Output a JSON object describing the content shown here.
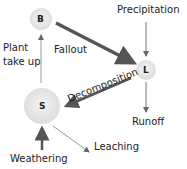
{
  "nodes": [
    {
      "id": "B",
      "label": "B"
    },
    {
      "id": "L",
      "label": "L"
    },
    {
      "id": "S",
      "label": "S"
    }
  ],
  "labels": {
    "precipitation": "Precipitation",
    "plant_take_up_1": "Plant",
    "plant_take_up_2": "take up",
    "fallout": "Fallout",
    "decomposition": "Decomposition",
    "runoff": "Runoff",
    "leaching": "Leaching",
    "weathering": "Weathering"
  },
  "colors": {
    "node_fill": "#e6e6e6",
    "thick_arrow": "#555555",
    "thin_arrow": "#777777"
  }
}
